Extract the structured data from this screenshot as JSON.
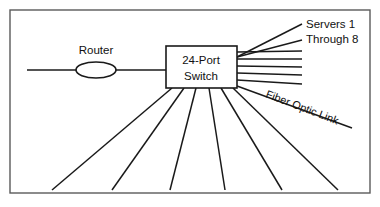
{
  "diagram": {
    "type": "network-topology",
    "canvas": {
      "width": 380,
      "height": 207,
      "background": "#ffffff"
    },
    "frame": {
      "x": 10,
      "y": 10,
      "width": 360,
      "height": 183,
      "stroke": "#5a5a5a"
    },
    "line_color": "#1a1a1a",
    "text_color": "#111111",
    "nodes": {
      "router": {
        "label": "Router",
        "shape": "ellipse",
        "cx": 96,
        "cy": 70,
        "rx": 20,
        "ry": 8,
        "label_x": 96,
        "label_y": 54
      },
      "switch": {
        "label_line1": "24-Port",
        "label_line2": "Switch",
        "shape": "rect",
        "x": 166,
        "y": 46,
        "width": 71,
        "height": 42,
        "label_x": 201,
        "label_y1": 64,
        "label_y2": 80
      }
    },
    "labels": {
      "servers_line1": "Servers 1",
      "servers_line2": "Through 8",
      "servers_x": 306,
      "servers_y1": 28,
      "servers_y2": 43,
      "fiber": "Fiber Optic Link",
      "fiber_x": 265,
      "fiber_y": 97,
      "fiber_rotation": 21
    },
    "uplink": {
      "from_x": 27,
      "to_x": 166,
      "y": 70
    },
    "server_fan": {
      "origin_x": 237,
      "origin_y": 57,
      "lines": [
        {
          "x1": 237,
          "y1": 57,
          "x2": 302,
          "y2": 24
        },
        {
          "x1": 237,
          "y1": 57,
          "x2": 302,
          "y2": 40
        },
        {
          "x1": 237,
          "y1": 52,
          "x2": 302,
          "y2": 51
        },
        {
          "x1": 237,
          "y1": 59,
          "x2": 302,
          "y2": 59
        },
        {
          "x1": 237,
          "y1": 66,
          "x2": 302,
          "y2": 67
        },
        {
          "x1": 237,
          "y1": 73,
          "x2": 302,
          "y2": 75
        },
        {
          "x1": 237,
          "y1": 80,
          "x2": 302,
          "y2": 84
        }
      ]
    },
    "fiber_link": {
      "x1": 237,
      "y1": 86,
      "x2": 352,
      "y2": 128
    },
    "port_fan": {
      "lines": [
        {
          "x1": 172,
          "y1": 88,
          "x2": 52,
          "y2": 190
        },
        {
          "x1": 184,
          "y1": 88,
          "x2": 112,
          "y2": 190
        },
        {
          "x1": 196,
          "y1": 88,
          "x2": 170,
          "y2": 190
        },
        {
          "x1": 209,
          "y1": 88,
          "x2": 225,
          "y2": 190
        },
        {
          "x1": 221,
          "y1": 88,
          "x2": 282,
          "y2": 190
        },
        {
          "x1": 233,
          "y1": 88,
          "x2": 338,
          "y2": 190
        }
      ]
    }
  }
}
